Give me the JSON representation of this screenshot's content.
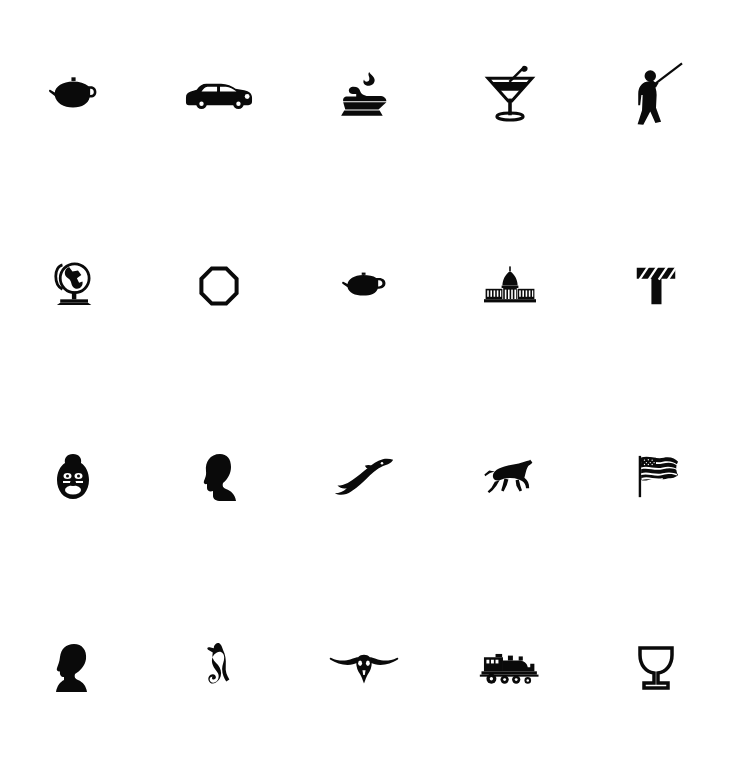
{
  "page": {
    "background_color": "#ffffff",
    "ink_color": "#0a0a0a",
    "width": 729,
    "height": 763,
    "columns": 5,
    "rows": 4
  },
  "grid": {
    "icons": [
      {
        "id": "teapot-large",
        "name": "teapot-icon",
        "label": "Teapot",
        "row": 1,
        "col": 1,
        "size": 52
      },
      {
        "id": "classic-car",
        "name": "classic-car-icon",
        "label": "Classic car",
        "row": 1,
        "col": 2,
        "size": 66
      },
      {
        "id": "anvil-flame",
        "name": "anvil-flame-icon",
        "label": "Anvil with flame",
        "row": 1,
        "col": 3,
        "size": 50
      },
      {
        "id": "cocktail-glass",
        "name": "cocktail-glass-icon",
        "label": "Cocktail glass",
        "row": 1,
        "col": 4,
        "size": 52
      },
      {
        "id": "marching-figure",
        "name": "marching-figure-icon",
        "label": "Figure with raised pole",
        "row": 1,
        "col": 5,
        "size": 56
      },
      {
        "id": "globe-stand",
        "name": "globe-icon",
        "label": "World globe on stand",
        "row": 2,
        "col": 1,
        "size": 48
      },
      {
        "id": "octagon-ring",
        "name": "octagon-ring-icon",
        "label": "Octagon ring",
        "row": 2,
        "col": 2,
        "size": 38
      },
      {
        "id": "teapot-small",
        "name": "small-teapot-icon",
        "label": "Small teapot",
        "row": 2,
        "col": 3,
        "size": 42
      },
      {
        "id": "capitol",
        "name": "capitol-building-icon",
        "label": "Capitol building",
        "row": 2,
        "col": 4,
        "size": 58
      },
      {
        "id": "letter-t",
        "name": "letter-t-icon",
        "label": "Letter T",
        "row": 2,
        "col": 5,
        "size": 44
      },
      {
        "id": "clown-face",
        "name": "clown-face-icon",
        "label": "Clown face",
        "row": 3,
        "col": 1,
        "size": 38
      },
      {
        "id": "woman-profile",
        "name": "woman-profile-icon",
        "label": "Woman profile cameo",
        "row": 3,
        "col": 2,
        "size": 40
      },
      {
        "id": "dolphin",
        "name": "dolphin-icon",
        "label": "Leaping dolphin",
        "row": 3,
        "col": 3,
        "size": 56
      },
      {
        "id": "running-horse",
        "name": "running-horse-icon",
        "label": "Galloping horse",
        "row": 3,
        "col": 4,
        "size": 52
      },
      {
        "id": "usa-flag",
        "name": "american-flag-icon",
        "label": "American flag",
        "row": 3,
        "col": 5,
        "size": 44
      },
      {
        "id": "man-profile",
        "name": "man-profile-icon",
        "label": "Man profile bust",
        "row": 4,
        "col": 1,
        "size": 42
      },
      {
        "id": "seahorse",
        "name": "seahorse-icon",
        "label": "Seahorse",
        "row": 4,
        "col": 2,
        "size": 42
      },
      {
        "id": "longhorn-skull",
        "name": "longhorn-skull-icon",
        "label": "Longhorn steer skull",
        "row": 4,
        "col": 3,
        "size": 66
      },
      {
        "id": "locomotive",
        "name": "steam-locomotive-icon",
        "label": "Steam locomotive",
        "row": 4,
        "col": 4,
        "size": 56
      },
      {
        "id": "goblet",
        "name": "goblet-icon",
        "label": "Goblet chalice",
        "row": 4,
        "col": 5,
        "size": 38
      }
    ]
  }
}
